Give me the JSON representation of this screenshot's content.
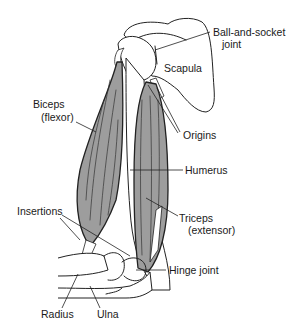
{
  "diagram": {
    "colors": {
      "muscle_fill": "#9d9d9d",
      "line": "#222222",
      "background": "#ffffff"
    },
    "labels": {
      "ball_socket_line1": "Ball-and-socket",
      "ball_socket_line2": "joint",
      "scapula": "Scapula",
      "biceps_line1": "Biceps",
      "biceps_line2": "(flexor)",
      "origins": "Origins",
      "humerus": "Humerus",
      "insertions": "Insertions",
      "triceps_line1": "Triceps",
      "triceps_line2": "(extensor)",
      "hinge_joint": "Hinge joint",
      "radius": "Radius",
      "ulna": "Ulna"
    }
  }
}
